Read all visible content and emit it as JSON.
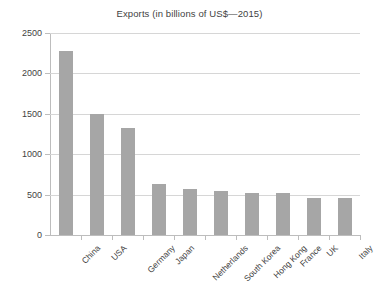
{
  "chart_data": {
    "type": "bar",
    "title": "Exports (in billions of US$—2015)",
    "xlabel": "",
    "ylabel": "",
    "categories": [
      "China",
      "USA",
      "Germany",
      "Japan",
      "Netherlands",
      "South Korea",
      "Hong Kong",
      "France",
      "UK",
      "Italy"
    ],
    "values": [
      2275,
      1500,
      1330,
      630,
      570,
      545,
      525,
      515,
      460,
      460
    ],
    "ylim": [
      0,
      2500
    ],
    "ytick_labels": [
      "0",
      "500",
      "1000",
      "1500",
      "2000",
      "2500"
    ],
    "ytick_values": [
      0,
      500,
      1000,
      1500,
      2000,
      2500
    ],
    "grid": true,
    "legend": false,
    "bar_color": "#a6a6a6",
    "gridline_color": "#d6d6d6",
    "axis_color": "#bdbdbd",
    "text_color": "#3f3f3f",
    "background": "#ffffff",
    "xtick_label_rotation": -45
  }
}
